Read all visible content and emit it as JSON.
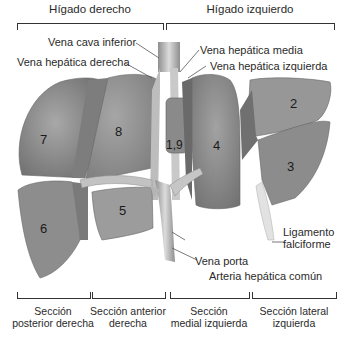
{
  "headers": {
    "right_liver": "Hígado derecho",
    "left_liver": "Hígado izquierdo"
  },
  "labels": {
    "ivc": "Vena cava inferior",
    "right_hepatic_vein": "Vena hepática derecha",
    "middle_hepatic_vein": "Vena hepática media",
    "left_hepatic_vein": "Vena hepática izquierda",
    "falciform_line1": "Ligamento",
    "falciform_line2": "falciforme",
    "portal_vein": "Vena porta",
    "common_hepatic_artery": "Arteria hepática común"
  },
  "segments": {
    "s2": "2",
    "s3": "3",
    "s4": "4",
    "s5": "5",
    "s6": "6",
    "s7": "7",
    "s8": "8",
    "s1_9": "1,9"
  },
  "sections": [
    {
      "line1": "Sección",
      "line2": "posterior derecha"
    },
    {
      "line1": "Sección anterior",
      "line2": "derecha"
    },
    {
      "line1": "Sección",
      "line2": "medial izquierda"
    },
    {
      "line1": "Sección lateral",
      "line2": "izquierda"
    }
  ],
  "colors": {
    "lobe_fill": "#9a9a9a",
    "lobe_light": "#b8b8b8",
    "lobe_dark": "#6f6f6f",
    "vessel": "#c9c9c9",
    "text": "#2a2a2a"
  }
}
